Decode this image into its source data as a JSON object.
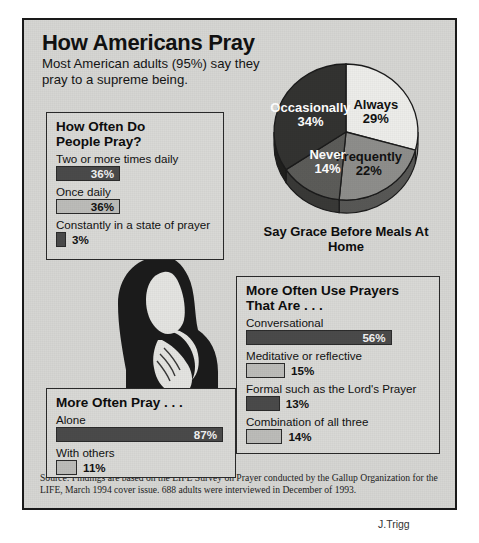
{
  "headline": "How Americans Pray",
  "subhead": "Most American adults (95%) say they pray to a supreme being.",
  "panels": {
    "how_often": {
      "title": "How Often Do\nPeople Pray?",
      "items": [
        {
          "label": "Two or more times daily",
          "value": "36%",
          "pct": 36,
          "shade": "dark"
        },
        {
          "label": "Once daily",
          "value": "36%",
          "pct": 36,
          "shade": "light"
        },
        {
          "label": "Constantly in a state of prayer",
          "value": "3%",
          "pct": 3,
          "shade": "dark"
        }
      ]
    },
    "more_often_pray": {
      "title": "More Often Pray . . .",
      "items": [
        {
          "label": "Alone",
          "value": "87%",
          "pct": 87,
          "shade": "dark"
        },
        {
          "label": "With others",
          "value": "11%",
          "pct": 11,
          "shade": "light"
        }
      ]
    },
    "prayers_that_are": {
      "title": "More Often Use Prayers\nThat Are . . .",
      "items": [
        {
          "label": "Conversational",
          "value": "56%",
          "pct": 56,
          "shade": "dark"
        },
        {
          "label": "Meditative or reflective",
          "value": "15%",
          "pct": 15,
          "shade": "light"
        },
        {
          "label": "Formal such as the Lord's Prayer",
          "value": "13%",
          "pct": 13,
          "shade": "dark"
        },
        {
          "label": "Combination of all three",
          "value": "14%",
          "pct": 14,
          "shade": "light"
        }
      ]
    }
  },
  "chart_data": {
    "type": "pie",
    "title": "Say Grace Before Meals At Home",
    "categories": [
      "Always",
      "Frequently",
      "Never",
      "Occasionally"
    ],
    "values": [
      29,
      22,
      14,
      34
    ],
    "value_labels": [
      "29%",
      "22%",
      "14%",
      "34%"
    ],
    "colors": [
      "#ededea",
      "#8e8e8b",
      "#5c5c59",
      "#333331"
    ],
    "label_text_colors": [
      "#111111",
      "#111111",
      "#ffffff",
      "#ffffff"
    ],
    "legend": "inside-slices",
    "unit": "%"
  },
  "source": "Source: Findings are based on the LIFE Survey on Prayer conducted by the Gallup Organization for the LIFE, March 1994 cover issue. 688 adults were interviewed in December of 1993.",
  "credit": "J.Trigg"
}
